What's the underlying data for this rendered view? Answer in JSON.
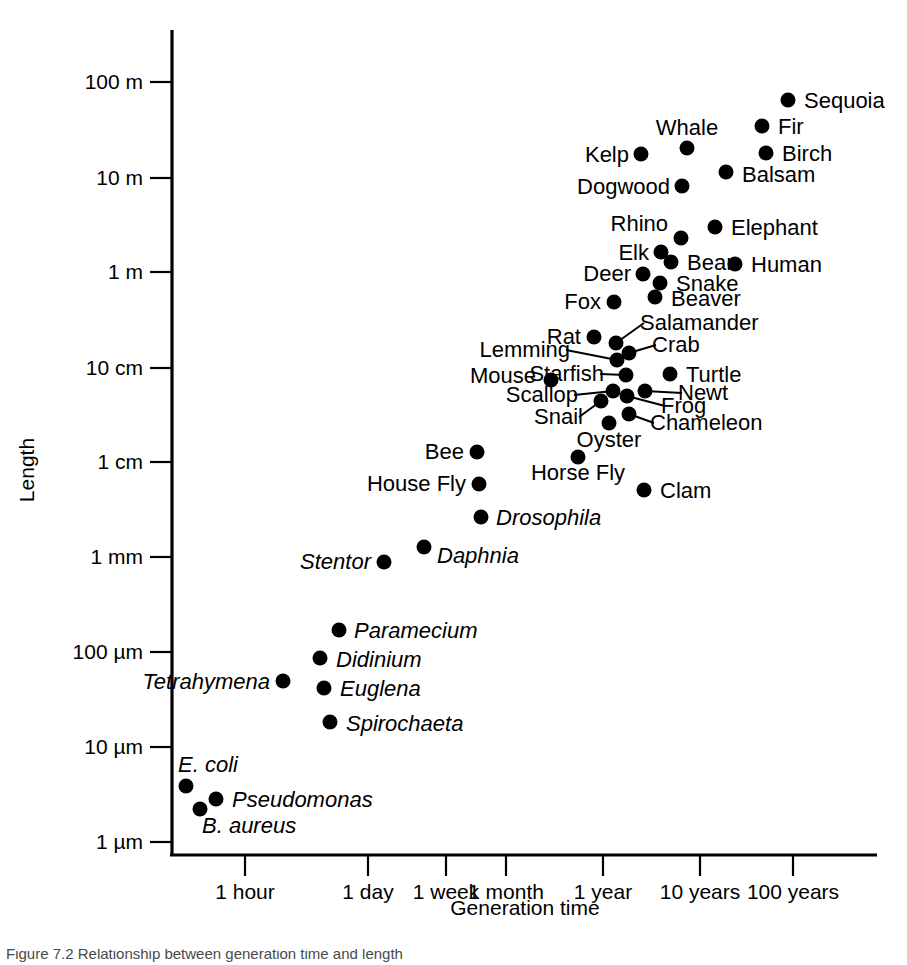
{
  "chart_data": {
    "type": "scatter",
    "title": "",
    "xlabel": "Generation time",
    "ylabel": "Length",
    "xscale": "log",
    "yscale": "log",
    "grid": false,
    "legend": "none",
    "xticks": [
      "1 hour",
      "1 day",
      "1 week",
      "1 month",
      "1 year",
      "10 years",
      "100 years"
    ],
    "yticks": [
      "100 m",
      "10 m",
      "1 m",
      "10 cm",
      "1 cm",
      "1 mm",
      "100 µm",
      "10 µm",
      "1 µm"
    ],
    "xlim": [
      "~20 minutes",
      "~300 years"
    ],
    "ylim": [
      "1 µm",
      "~300 m"
    ],
    "points": [
      {
        "label": "Sequoia",
        "italic": false,
        "x": 788,
        "y": 100,
        "lx": 804,
        "ly": 108,
        "anchor": "start"
      },
      {
        "label": "Fir",
        "italic": false,
        "x": 762,
        "y": 126,
        "lx": 778,
        "ly": 134,
        "anchor": "start"
      },
      {
        "label": "Whale",
        "italic": false,
        "x": 687,
        "y": 148,
        "lx": 687,
        "ly": 135,
        "anchor": "middle"
      },
      {
        "label": "Birch",
        "italic": false,
        "x": 766,
        "y": 153,
        "lx": 782,
        "ly": 161,
        "anchor": "start"
      },
      {
        "label": "Kelp",
        "italic": false,
        "x": 641,
        "y": 154,
        "lx": 629,
        "ly": 162,
        "anchor": "end"
      },
      {
        "label": "Balsam",
        "italic": false,
        "x": 726,
        "y": 172,
        "lx": 742,
        "ly": 182,
        "anchor": "start"
      },
      {
        "label": "Dogwood",
        "italic": false,
        "x": 682,
        "y": 186,
        "lx": 670,
        "ly": 194,
        "anchor": "end"
      },
      {
        "label": "Rhino",
        "italic": false,
        "x": 681,
        "y": 238,
        "lx": 668,
        "ly": 231,
        "anchor": "end"
      },
      {
        "label": "Elephant",
        "italic": false,
        "x": 715,
        "y": 227,
        "lx": 731,
        "ly": 235,
        "anchor": "start"
      },
      {
        "label": "Elk",
        "italic": false,
        "x": 661,
        "y": 252,
        "lx": 649,
        "ly": 260,
        "anchor": "end"
      },
      {
        "label": "Bear",
        "italic": false,
        "x": 671,
        "y": 262,
        "lx": 687,
        "ly": 270,
        "anchor": "start"
      },
      {
        "label": "Human",
        "italic": false,
        "x": 735,
        "y": 264,
        "lx": 751,
        "ly": 272,
        "anchor": "start"
      },
      {
        "label": "Deer",
        "italic": false,
        "x": 643,
        "y": 274,
        "lx": 631,
        "ly": 281,
        "anchor": "end"
      },
      {
        "label": "Snake",
        "italic": false,
        "x": 660,
        "y": 283,
        "lx": 676,
        "ly": 291,
        "anchor": "start"
      },
      {
        "label": "Beaver",
        "italic": false,
        "x": 655,
        "y": 297,
        "lx": 671,
        "ly": 306,
        "anchor": "start"
      },
      {
        "label": "Fox",
        "italic": false,
        "x": 614,
        "y": 302,
        "lx": 601,
        "ly": 309,
        "anchor": "end"
      },
      {
        "label": "Rat",
        "italic": false,
        "x": 594,
        "y": 337,
        "lx": 581,
        "ly": 344,
        "anchor": "end"
      },
      {
        "label": "Salamander",
        "italic": false,
        "x": 616,
        "y": 343,
        "lx": 640,
        "ly": 330,
        "anchor": "start",
        "leader": true
      },
      {
        "label": "Lemming",
        "italic": false,
        "x": 617,
        "y": 360,
        "lx": 570,
        "ly": 357,
        "anchor": "end",
        "leader": true
      },
      {
        "label": "Crab",
        "italic": false,
        "x": 629,
        "y": 353,
        "lx": 652,
        "ly": 352,
        "anchor": "start",
        "leader": true
      },
      {
        "label": "Mouse",
        "italic": false,
        "x": 551,
        "y": 380,
        "lx": 536,
        "ly": 383,
        "anchor": "end"
      },
      {
        "label": "Starfish",
        "italic": false,
        "x": 626,
        "y": 375,
        "lx": 604,
        "ly": 381,
        "anchor": "end",
        "leader": true
      },
      {
        "label": "Turtle",
        "italic": false,
        "x": 670,
        "y": 374,
        "lx": 686,
        "ly": 382,
        "anchor": "start"
      },
      {
        "label": "Scallop",
        "italic": false,
        "x": 613,
        "y": 391,
        "lx": 578,
        "ly": 402,
        "anchor": "end",
        "leader": true
      },
      {
        "label": "Newt",
        "italic": false,
        "x": 645,
        "y": 391,
        "lx": 678,
        "ly": 400,
        "anchor": "start",
        "leader": true
      },
      {
        "label": "Frog",
        "italic": false,
        "x": 627,
        "y": 396,
        "lx": 661,
        "ly": 413,
        "anchor": "start",
        "leader": true
      },
      {
        "label": "Snail",
        "italic": false,
        "x": 601,
        "y": 401,
        "lx": 583,
        "ly": 424,
        "anchor": "end",
        "leader": true
      },
      {
        "label": "Chameleon",
        "italic": false,
        "x": 629,
        "y": 414,
        "lx": 650,
        "ly": 430,
        "anchor": "start",
        "leader": true
      },
      {
        "label": "Oyster",
        "italic": false,
        "x": 609,
        "y": 423,
        "lx": 609,
        "ly": 447,
        "anchor": "middle"
      },
      {
        "label": "Bee",
        "italic": false,
        "x": 477,
        "y": 452,
        "lx": 464,
        "ly": 459,
        "anchor": "end"
      },
      {
        "label": "Horse Fly",
        "italic": false,
        "x": 578,
        "y": 457,
        "lx": 578,
        "ly": 480,
        "anchor": "middle"
      },
      {
        "label": "House Fly",
        "italic": false,
        "x": 479,
        "y": 484,
        "lx": 466,
        "ly": 491,
        "anchor": "end"
      },
      {
        "label": "Clam",
        "italic": false,
        "x": 644,
        "y": 490,
        "lx": 660,
        "ly": 498,
        "anchor": "start"
      },
      {
        "label": "Drosophila",
        "italic": true,
        "x": 481,
        "y": 517,
        "lx": 496,
        "ly": 525,
        "anchor": "start"
      },
      {
        "label": "Daphnia",
        "italic": true,
        "x": 424,
        "y": 547,
        "lx": 437,
        "ly": 563,
        "anchor": "start"
      },
      {
        "label": "Stentor",
        "italic": true,
        "x": 384,
        "y": 562,
        "lx": 371,
        "ly": 569,
        "anchor": "end"
      },
      {
        "label": "Paramecium",
        "italic": true,
        "x": 339,
        "y": 630,
        "lx": 354,
        "ly": 638,
        "anchor": "start"
      },
      {
        "label": "Didinium",
        "italic": true,
        "x": 320,
        "y": 658,
        "lx": 336,
        "ly": 667,
        "anchor": "start"
      },
      {
        "label": "Tetrahymena",
        "italic": true,
        "x": 283,
        "y": 681,
        "lx": 270,
        "ly": 689,
        "anchor": "end"
      },
      {
        "label": "Euglena",
        "italic": true,
        "x": 324,
        "y": 688,
        "lx": 340,
        "ly": 696,
        "anchor": "start"
      },
      {
        "label": "Spirochaeta",
        "italic": true,
        "x": 330,
        "y": 722,
        "lx": 346,
        "ly": 731,
        "anchor": "start"
      },
      {
        "label": "E. coli",
        "italic": true,
        "x": 186,
        "y": 786,
        "lx": 178,
        "ly": 772,
        "anchor": "start"
      },
      {
        "label": "Pseudomonas",
        "italic": true,
        "x": 216,
        "y": 799,
        "lx": 232,
        "ly": 807,
        "anchor": "start"
      },
      {
        "label": "B. aureus",
        "italic": true,
        "x": 200,
        "y": 809,
        "lx": 202,
        "ly": 833,
        "anchor": "start"
      }
    ]
  },
  "axes": {
    "x_axis_title": "Generation time",
    "y_axis_title": "Length",
    "x_ticks": [
      {
        "label": "1 hour",
        "px": 245
      },
      {
        "label": "1 day",
        "px": 368
      },
      {
        "label": "1 week",
        "px": 446
      },
      {
        "label": "1 month",
        "px": 506
      },
      {
        "label": "1 year",
        "px": 603
      },
      {
        "label": "10 years",
        "px": 700
      },
      {
        "label": "100 years",
        "px": 793
      }
    ],
    "y_ticks": [
      {
        "label": "100 m",
        "py": 82
      },
      {
        "label": "10 m",
        "py": 178
      },
      {
        "label": "1 m",
        "py": 272
      },
      {
        "label": "10 cm",
        "py": 368
      },
      {
        "label": "1 cm",
        "py": 462
      },
      {
        "label": "1 mm",
        "py": 557
      },
      {
        "label": "100 µm",
        "py": 652
      },
      {
        "label": "10 µm",
        "py": 747
      },
      {
        "label": "1 µm",
        "py": 842
      }
    ]
  },
  "caption": {
    "text": "Figure 7.2  Relationship between generation time and length"
  },
  "colors": {
    "ink": "#000000",
    "background": "#ffffff",
    "caption": "#4a4a4a"
  }
}
